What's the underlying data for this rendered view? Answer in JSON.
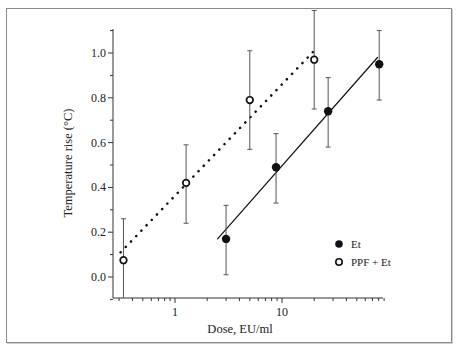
{
  "chart_data": {
    "type": "scatter",
    "title": "",
    "xlabel": "Dose, EU/ml",
    "ylabel": "Temperature rise (°C)",
    "xscale": "log",
    "xlim": [
      0.3,
      90
    ],
    "ylim": [
      -0.1,
      1.1
    ],
    "xticks": [
      {
        "value": 1,
        "label": "1"
      },
      {
        "value": 10,
        "label": "10"
      }
    ],
    "yticks": [
      {
        "value": 0.0,
        "label": "0.0"
      },
      {
        "value": 0.2,
        "label": "0.2"
      },
      {
        "value": 0.4,
        "label": "0.4"
      },
      {
        "value": 0.6,
        "label": "0.6"
      },
      {
        "value": 0.8,
        "label": "0.8"
      },
      {
        "value": 1.0,
        "label": "1.0"
      }
    ],
    "grid": false,
    "legend_position": "lower right",
    "series": [
      {
        "name": "Et",
        "marker": "filled-circle",
        "fit_line": "solid",
        "x": [
          3.0,
          8.8,
          27,
          81
        ],
        "y": [
          0.17,
          0.49,
          0.74,
          0.95
        ],
        "err_low": [
          0.01,
          0.33,
          0.58,
          0.79
        ],
        "err_high": [
          0.32,
          0.64,
          0.89,
          1.1
        ],
        "fit": {
          "x": [
            2.5,
            78
          ],
          "y": [
            0.17,
            0.98
          ]
        }
      },
      {
        "name": "PPF + Et",
        "marker": "open-circle",
        "fit_line": "dotted",
        "x": [
          0.33,
          1.27,
          5.0,
          20
        ],
        "y": [
          0.075,
          0.42,
          0.79,
          0.97
        ],
        "err_low": [
          -0.1,
          0.24,
          0.57,
          0.75
        ],
        "err_high": [
          0.26,
          0.59,
          1.01,
          1.19
        ],
        "fit": {
          "x": [
            0.31,
            20
          ],
          "y": [
            0.11,
            1.01
          ]
        }
      }
    ]
  },
  "legend": {
    "items": [
      {
        "label": "Et"
      },
      {
        "label": "PPF + Et"
      }
    ]
  }
}
